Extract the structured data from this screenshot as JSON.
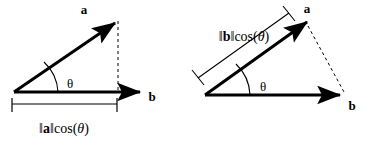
{
  "figure": {
    "background_color": "#ffffff",
    "stroke_color": "#000000",
    "panels": [
      {
        "id": "left",
        "name": "projection-of-a-onto-b",
        "vector_a_label": "a",
        "vector_b_label": "b",
        "angle_label": "θ",
        "measure_label_parts": {
          "bar_open": "‖",
          "vector": "a",
          "bar_close": "‖",
          "function": "cos(",
          "theta": "θ",
          "paren_close": ")"
        },
        "measure_label_text": "‖a‖cos(θ)",
        "drop_line_style": "dashed",
        "measure_bracket_position": "below-baseline"
      },
      {
        "id": "right",
        "name": "projection-of-b-onto-a",
        "vector_a_label": "a",
        "vector_b_label": "b",
        "angle_label": "θ",
        "measure_label_parts": {
          "bar_open": "‖",
          "vector": "b",
          "bar_close": "‖",
          "function": "cos(",
          "theta": "θ",
          "paren_close": ")"
        },
        "measure_label_text": "‖b‖cos(θ)",
        "drop_line_style": "dashed",
        "measure_bracket_position": "parallel-above-vector-a"
      }
    ]
  }
}
